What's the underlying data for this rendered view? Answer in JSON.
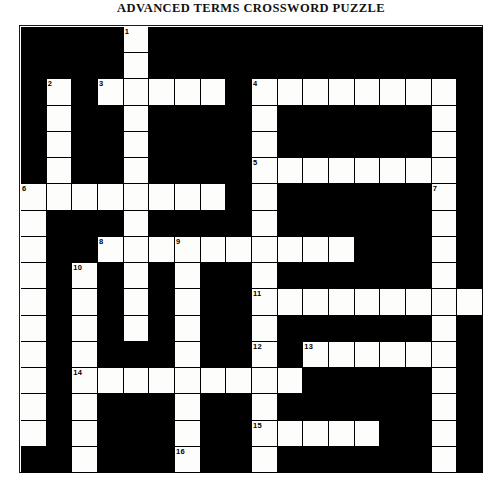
{
  "title": "ADVANCED TERMS CROSSWORD PUZZLE",
  "puzzle": {
    "kind": "crossword-grid",
    "columns": 18,
    "rows": 17,
    "cell_colors": {
      "open": "#fdfdfb",
      "blocked": "#000000",
      "border": "#000000"
    },
    "clue_numbers_visible": [
      1,
      2,
      3,
      4,
      5,
      6,
      7,
      8,
      9,
      10,
      11,
      12,
      13,
      14,
      15,
      16
    ],
    "numbers": {
      "0_4": "1",
      "2_1": "2",
      "2_3": "3",
      "2_9": "4",
      "5_9": "5",
      "6_0": "6",
      "6_16": "7",
      "8_3": "8",
      "8_6": "9",
      "9_2": "10",
      "10_9": "11",
      "12_9": "12",
      "12_11": "13",
      "13_2": "14",
      "15_9": "15",
      "16_6": "16"
    },
    "white_cells": [
      "0_4",
      "1_4",
      "2_1",
      "2_3",
      "2_4",
      "2_5",
      "2_6",
      "2_7",
      "2_9",
      "2_10",
      "2_11",
      "2_12",
      "2_13",
      "2_14",
      "2_15",
      "2_16",
      "3_1",
      "3_4",
      "3_9",
      "3_16",
      "4_1",
      "4_4",
      "4_9",
      "4_16",
      "5_1",
      "5_4",
      "5_9",
      "5_10",
      "5_11",
      "5_12",
      "5_13",
      "5_14",
      "5_15",
      "5_16",
      "6_0",
      "6_1",
      "6_2",
      "6_3",
      "6_4",
      "6_5",
      "6_6",
      "6_7",
      "6_9",
      "6_16",
      "7_0",
      "7_4",
      "7_9",
      "7_16",
      "8_0",
      "8_3",
      "8_4",
      "8_5",
      "8_6",
      "8_7",
      "8_8",
      "8_9",
      "8_10",
      "8_11",
      "8_12",
      "8_16",
      "9_0",
      "9_2",
      "9_4",
      "9_6",
      "9_9",
      "9_16",
      "10_0",
      "10_2",
      "10_4",
      "10_6",
      "10_9",
      "10_10",
      "10_11",
      "10_12",
      "10_13",
      "10_14",
      "10_15",
      "10_16",
      "10_17",
      "11_0",
      "11_2",
      "11_4",
      "11_6",
      "11_9",
      "11_16",
      "12_0",
      "12_2",
      "12_6",
      "12_9",
      "12_11",
      "12_12",
      "12_13",
      "12_14",
      "12_15",
      "12_16",
      "13_0",
      "13_2",
      "13_3",
      "13_4",
      "13_5",
      "13_6",
      "13_7",
      "13_8",
      "13_9",
      "13_10",
      "13_16",
      "14_0",
      "14_2",
      "14_6",
      "14_9",
      "14_16",
      "15_0",
      "15_2",
      "15_6",
      "15_9",
      "15_10",
      "15_11",
      "15_12",
      "15_13",
      "15_16",
      "16_2",
      "16_6",
      "16_9",
      "16_16",
      "17_2",
      "17_6",
      "17_9",
      "17_16",
      "18_6",
      "18_7",
      "18_8",
      "18_9",
      "18_10",
      "18_11",
      "18_12",
      "18_13",
      "18_16",
      "19_9"
    ]
  }
}
